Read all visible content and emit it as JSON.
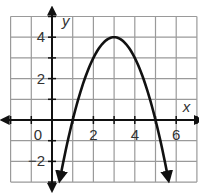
{
  "chart_data": {
    "type": "line",
    "title": "",
    "xlabel": "x",
    "ylabel": "y",
    "xlim": [
      -2,
      7
    ],
    "ylim": [
      -3,
      5
    ],
    "grid": true,
    "x_ticks": [
      {
        "value": 0,
        "label": "0"
      },
      {
        "value": 2,
        "label": "2"
      },
      {
        "value": 4,
        "label": "4"
      },
      {
        "value": 6,
        "label": "6"
      }
    ],
    "y_ticks": [
      {
        "value": 4,
        "label": "4"
      },
      {
        "value": 2,
        "label": "2"
      },
      {
        "value": -2,
        "label": "−2"
      }
    ],
    "series": [
      {
        "name": "parabola",
        "equation": "y = -(x-1)(x-5)",
        "vertex": [
          3,
          4
        ],
        "x_intercepts": [
          1,
          5
        ],
        "arrows_on_ends": true,
        "x": [
          0.4,
          1,
          2,
          3,
          4,
          5,
          5.6
        ],
        "y": [
          -2.84,
          0,
          3,
          4,
          3,
          0,
          -2.84
        ]
      }
    ],
    "colors": {
      "curve": "#111111",
      "grid": "#9a9a9a",
      "axes": "#111111"
    }
  }
}
